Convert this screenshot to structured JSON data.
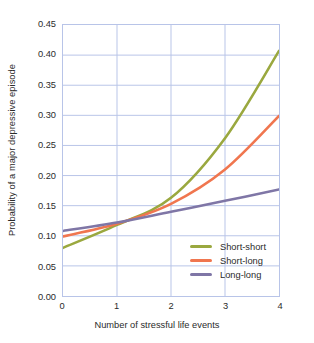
{
  "chart_data": {
    "type": "line",
    "title": "",
    "xlabel": "Number of stressful life events",
    "ylabel": "Probability of a major depressive episode",
    "x": [
      0,
      1,
      2,
      3,
      4
    ],
    "xlim": [
      0,
      4
    ],
    "ylim": [
      0.0,
      0.45
    ],
    "xticks": [
      "0",
      "1",
      "2",
      "3",
      "4"
    ],
    "yticks": [
      "0.00",
      "0.05",
      "0.10",
      "0.15",
      "0.20",
      "0.25",
      "0.30",
      "0.35",
      "0.40",
      "0.45"
    ],
    "ytick_values": [
      0.0,
      0.05,
      0.1,
      0.15,
      0.2,
      0.25,
      0.3,
      0.35,
      0.4,
      0.45
    ],
    "grid": true,
    "grid_color": "#b8c4e8",
    "legend_position": "lower-right",
    "series": [
      {
        "name": "Short-short",
        "color": "#9aa83f",
        "values": [
          0.08,
          0.118,
          0.163,
          0.262,
          0.407
        ]
      },
      {
        "name": "Short-long",
        "color": "#f0764f",
        "values": [
          0.099,
          0.12,
          0.153,
          0.21,
          0.299
        ]
      },
      {
        "name": "Long-long",
        "color": "#7f76a6",
        "values": [
          0.108,
          0.122,
          0.14,
          0.158,
          0.177
        ]
      }
    ]
  }
}
